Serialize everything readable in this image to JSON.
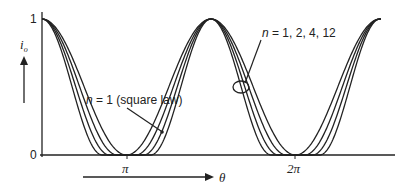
{
  "chart_data": {
    "type": "line",
    "title": "",
    "xlabel": "θ",
    "ylabel": "i_o",
    "x_ticks": [
      "π",
      "2π"
    ],
    "y_ticks": [
      "0",
      "1"
    ],
    "ylim": [
      0,
      1
    ],
    "grid": false,
    "series_exponents": [
      1,
      2,
      4,
      12
    ],
    "annotations": [
      {
        "text": "n = 1, 2, 4, 12",
        "target": "curves crossing inside ellipse"
      },
      {
        "text": "n = 1 (square law)",
        "target": "innermost curve"
      }
    ]
  },
  "labels": {
    "y_one": "1",
    "y_zero": "0",
    "y_axis_var": "i",
    "y_axis_sub": "o",
    "tick_pi": "π",
    "tick_2pi": "2π",
    "theta": "θ",
    "ann_family_n": "n",
    "ann_family_rest": " = 1, 2, 4, 12",
    "ann_square_n": "n",
    "ann_square_rest": " = 1 (square law)"
  }
}
